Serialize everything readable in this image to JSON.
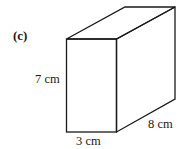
{
  "figure": {
    "part_label": "(c)",
    "shape": "cuboid",
    "dimensions": {
      "height": "7 cm",
      "width": "3 cm",
      "depth": "8 cm"
    },
    "stroke_color": "#1a1a1a",
    "background": "#ffffff"
  }
}
